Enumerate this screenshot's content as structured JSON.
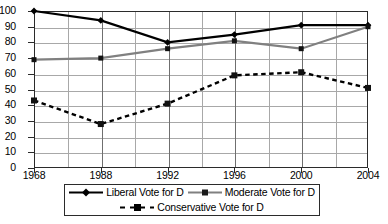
{
  "chart_data": {
    "type": "line",
    "title": "",
    "xlabel": "",
    "ylabel": "",
    "x": [
      1968,
      1988,
      1992,
      1996,
      2000,
      2004
    ],
    "categories": [
      "1968",
      "1988",
      "1992",
      "1996",
      "2000",
      "2004"
    ],
    "xtick_labels": [
      "1968",
      "1988",
      "1992",
      "1996",
      "2000",
      "2004"
    ],
    "ytick_labels": [
      "100",
      "90",
      "80",
      "70",
      "60",
      "50",
      "40",
      "30",
      "20",
      "10",
      "0"
    ],
    "yticks": [
      100,
      90,
      80,
      70,
      60,
      50,
      40,
      30,
      20,
      10,
      0
    ],
    "ylim": [
      0,
      100
    ],
    "xlim": [
      1968,
      2004
    ],
    "grid": true,
    "grid_axis": "both",
    "legend_position": "bottom",
    "series": [
      {
        "name": "Liberal Vote for D",
        "values": [
          100,
          94,
          80,
          85,
          91,
          91
        ],
        "color": "#000000",
        "style": "solid",
        "marker": "diamond"
      },
      {
        "name": "Moderate Vote for D",
        "values": [
          69,
          70,
          76,
          81,
          76,
          90
        ],
        "color": "#808080",
        "style": "solid",
        "marker": "square"
      },
      {
        "name": "Conservative Vote for D",
        "values": [
          43,
          28,
          41,
          59,
          61,
          51
        ],
        "color": "#000000",
        "style": "dashed",
        "marker": "square"
      }
    ]
  },
  "legend": {
    "items": [
      {
        "label": "Liberal Vote for D"
      },
      {
        "label": "Moderate Vote for D"
      },
      {
        "label": "Conservative Vote for D"
      }
    ]
  }
}
